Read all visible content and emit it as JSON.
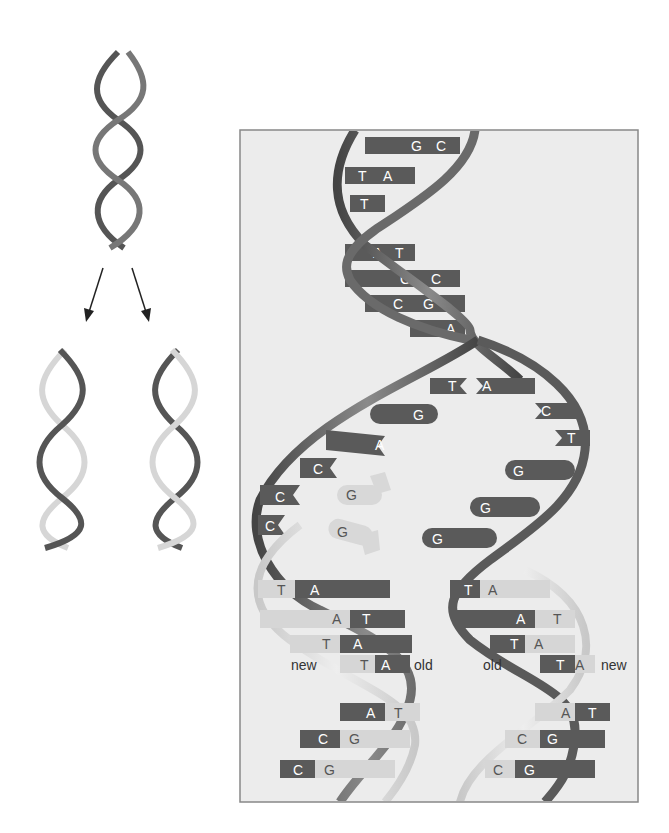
{
  "colors": {
    "old_strand": "#5a5a5a",
    "new_strand": "#d4d4d4",
    "panel_bg": "#ececec",
    "panel_border": "#888888",
    "arrow": "#222222"
  },
  "overview": {
    "parent_helix": "parent DNA double helix",
    "daughter_left": "daughter helix (new strand light, old strand dark)",
    "daughter_right": "daughter helix (old strand dark, new strand light)"
  },
  "detail": {
    "parent_pairs": [
      {
        "left": "G",
        "right": "C"
      },
      {
        "left": "T",
        "right": "A"
      },
      {
        "left": "T",
        "right": ""
      },
      {
        "left": "A",
        "right": "T"
      },
      {
        "left": "G",
        "right": "C"
      },
      {
        "left": "C",
        "right": "G"
      },
      {
        "left": "A",
        "right": ""
      }
    ],
    "fork_left_bases": [
      "T",
      "G",
      "A",
      "C",
      "C",
      "C"
    ],
    "fork_right_bases": [
      "A",
      "C",
      "T",
      "G",
      "G",
      "G"
    ],
    "free_nucleotides": [
      "G",
      "G"
    ],
    "left_daughter_pairs": [
      {
        "new": "T",
        "old": "A"
      },
      {
        "new": "A",
        "old": "T"
      },
      {
        "new": "T",
        "old": "A"
      },
      {
        "new": "T",
        "old": "A"
      },
      {
        "old": "A",
        "new": "T"
      },
      {
        "old": "C",
        "new": "G"
      },
      {
        "old": "C",
        "new": "G"
      }
    ],
    "right_daughter_pairs": [
      {
        "old": "T",
        "new": "A"
      },
      {
        "old": "A",
        "new": "T"
      },
      {
        "old": "T",
        "new": "A"
      },
      {
        "old": "T",
        "new": "A"
      },
      {
        "new": "A",
        "old": "T"
      },
      {
        "new": "C",
        "old": "G"
      },
      {
        "new": "C",
        "old": "G"
      }
    ],
    "labels": {
      "left_new": "new",
      "left_old": "old",
      "right_old": "old",
      "right_new": "new"
    }
  }
}
